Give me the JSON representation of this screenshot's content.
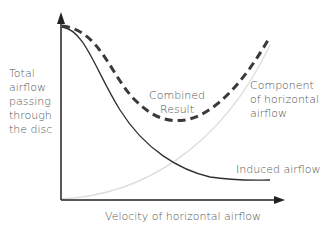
{
  "diagram": {
    "y_axis_label": [
      "Total",
      "airflow",
      "passing",
      "through",
      "the disc"
    ],
    "x_axis_label": "Velocity of horizontal airflow",
    "curves": [
      {
        "name": "Combined Result",
        "label_lines": [
          "Combined",
          "Result"
        ],
        "style": "dashed",
        "color": "#3a3a3a"
      },
      {
        "name": "Component of horizontal airflow",
        "label_lines": [
          "Component",
          "of horizontal",
          "airflow"
        ],
        "style": "solid-light",
        "color": "#d8d8d8"
      },
      {
        "name": "Induced airflow",
        "label_lines": [
          "Induced airflow"
        ],
        "style": "solid",
        "color": "#2f2f2f"
      }
    ]
  }
}
